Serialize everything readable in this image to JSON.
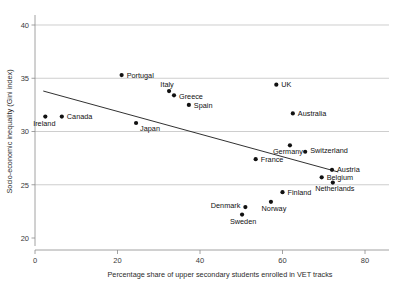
{
  "chart_data": {
    "type": "scatter",
    "title": "",
    "xlabel": "Percentage share of upper secondary students enrolled in VET tracks",
    "ylabel": "Socio-economic inequality (Gini index)",
    "xlim": [
      0,
      87
    ],
    "ylim": [
      20,
      41.8
    ],
    "xticks": [
      0,
      20,
      40,
      60,
      80
    ],
    "xtick_labels": [
      "0",
      "20",
      "40",
      "60",
      "80"
    ],
    "yticks": [
      20,
      25,
      30,
      35,
      40
    ],
    "ytick_labels": [
      "20",
      "25",
      "30",
      "35",
      "40"
    ],
    "grid": "horizontal",
    "legend": "none",
    "point_color": "#111111",
    "trendline_color": "#1a1a1a",
    "gridline_color": "#b9b9b9",
    "points": [
      {
        "label": "Ireland",
        "x": 2.5,
        "y": 31.4,
        "label_dx": -1,
        "label_dy": 9,
        "label_anchor": "middle"
      },
      {
        "label": "Canada",
        "x": 6.5,
        "y": 31.4,
        "label_dx": 5,
        "label_dy": 2.5,
        "label_anchor": "start"
      },
      {
        "label": "Portugal",
        "x": 21.0,
        "y": 35.3,
        "label_dx": 5,
        "label_dy": 2.5,
        "label_anchor": "start"
      },
      {
        "label": "Japan",
        "x": 24.5,
        "y": 30.8,
        "label_dx": 4,
        "label_dy": 8,
        "label_anchor": "start"
      },
      {
        "label": "Italy",
        "x": 32.5,
        "y": 33.8,
        "label_dx": -2,
        "label_dy": -4,
        "label_anchor": "middle"
      },
      {
        "label": "Greece",
        "x": 33.7,
        "y": 33.4,
        "label_dx": 5,
        "label_dy": 3.5,
        "label_anchor": "start"
      },
      {
        "label": "Spain",
        "x": 37.3,
        "y": 32.5,
        "label_dx": 5,
        "label_dy": 3.5,
        "label_anchor": "start"
      },
      {
        "label": "UK",
        "x": 58.5,
        "y": 34.4,
        "label_dx": 5,
        "label_dy": 2.5,
        "label_anchor": "start"
      },
      {
        "label": "Australia",
        "x": 62.5,
        "y": 31.7,
        "label_dx": 5,
        "label_dy": 2.5,
        "label_anchor": "start"
      },
      {
        "label": "Switzerland",
        "x": 65.5,
        "y": 28.1,
        "label_dx": 5,
        "label_dy": 1,
        "label_anchor": "start"
      },
      {
        "label": "Germany",
        "x": 61.8,
        "y": 28.7,
        "label_dx": -2,
        "label_dy": 9,
        "label_anchor": "middle"
      },
      {
        "label": "France",
        "x": 53.5,
        "y": 27.4,
        "label_dx": 5,
        "label_dy": 3,
        "label_anchor": "start"
      },
      {
        "label": "Austria",
        "x": 72.0,
        "y": 26.4,
        "label_dx": 5,
        "label_dy": 2.5,
        "label_anchor": "start"
      },
      {
        "label": "Belgium",
        "x": 69.5,
        "y": 25.7,
        "label_dx": 5,
        "label_dy": 2.5,
        "label_anchor": "start"
      },
      {
        "label": "Netherlands",
        "x": 72.2,
        "y": 25.2,
        "label_dx": 2,
        "label_dy": 8,
        "label_anchor": "middle"
      },
      {
        "label": "Finland",
        "x": 60.0,
        "y": 24.3,
        "label_dx": 5,
        "label_dy": 2.5,
        "label_anchor": "start"
      },
      {
        "label": "Norway",
        "x": 57.2,
        "y": 23.4,
        "label_dx": 3,
        "label_dy": 9,
        "label_anchor": "middle"
      },
      {
        "label": "Denmark",
        "x": 51.0,
        "y": 22.9,
        "label_dx": -5,
        "label_dy": 1,
        "label_anchor": "end"
      },
      {
        "label": "Sweden",
        "x": 50.2,
        "y": 22.2,
        "label_dx": 1,
        "label_dy": 9,
        "label_anchor": "middle"
      }
    ],
    "trendline": {
      "x_start": 2.0,
      "y_start": 33.8,
      "x_end": 73.5,
      "y_end": 26.2
    }
  }
}
